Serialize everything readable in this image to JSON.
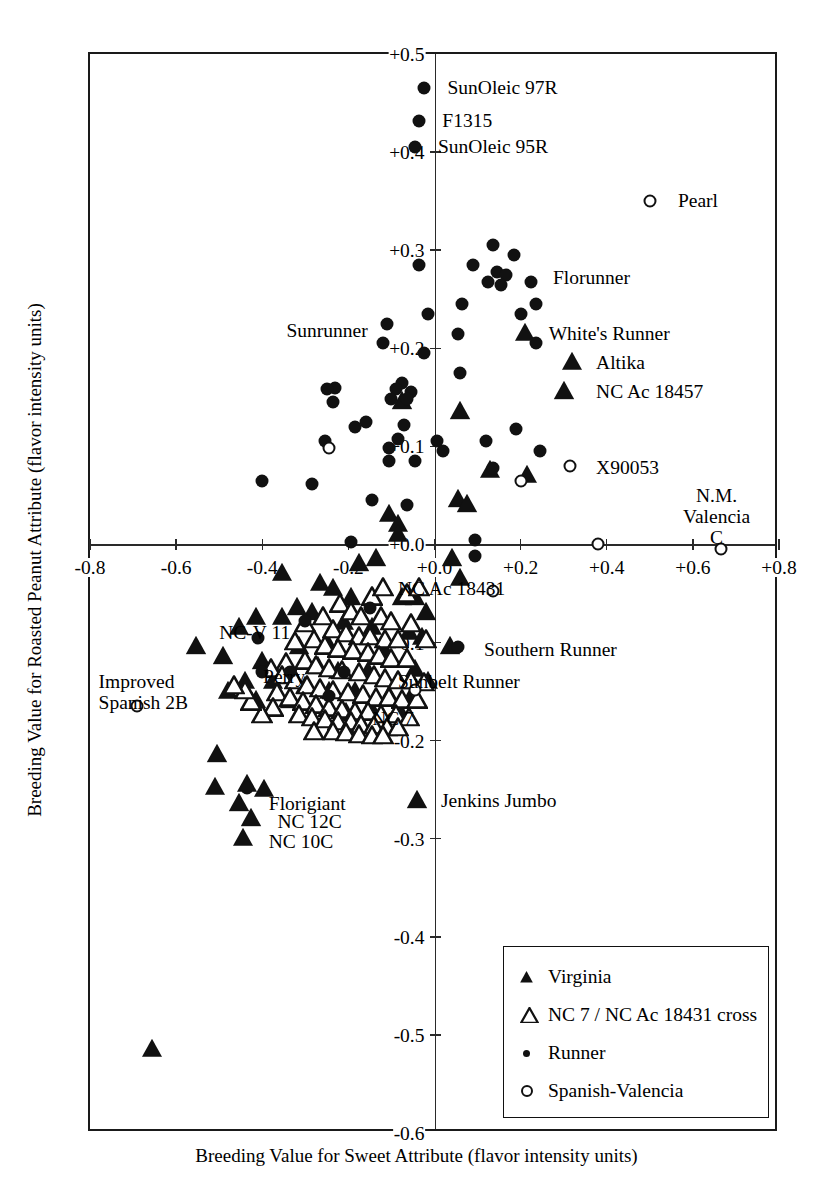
{
  "figure": {
    "x_title": "Breeding Value for Sweet Attribute (flavor intensity units)",
    "y_title": "Breeding Value for Roasted Peanut Attribute (flavor intensity units)"
  },
  "legend": {
    "items": [
      {
        "symbol": "filled-triangle-icon",
        "label": "Virginia"
      },
      {
        "symbol": "open-triangle-icon",
        "label": "NC 7 / NC Ac 18431 cross"
      },
      {
        "symbol": "small-filled-circle-icon",
        "label": "Runner"
      },
      {
        "symbol": "open-circle-icon",
        "label": "Spanish-Valencia"
      }
    ]
  },
  "chart_data": {
    "type": "scatter",
    "title": "",
    "xlabel": "Breeding Value for Sweet Attribute (flavor intensity units)",
    "ylabel": "Breeding Value for Roasted Peanut Attribute (flavor intensity units)",
    "xlim": [
      -0.8,
      0.8
    ],
    "ylim": [
      -0.6,
      0.5
    ],
    "xticks": [
      "-0.8",
      "-0.6",
      "-0.4",
      "-0.2",
      "+0.0",
      "+0.2",
      "+0.4",
      "+0.6",
      "+0.8"
    ],
    "xtick_values": [
      -0.8,
      -0.6,
      -0.4,
      -0.2,
      0.0,
      0.2,
      0.4,
      0.6,
      0.8
    ],
    "yticks": [
      "+0.5",
      "+0.4",
      "+0.3",
      "+0.2",
      "+0.1",
      "+0.0",
      "-0.1",
      "-0.2",
      "-0.3",
      "-0.4",
      "-0.5",
      "-0.6"
    ],
    "ytick_values": [
      0.5,
      0.4,
      0.3,
      0.2,
      0.1,
      0.0,
      -0.1,
      -0.2,
      -0.3,
      -0.4,
      -0.5,
      -0.6
    ],
    "grid": false,
    "legend_position": "bottom-right",
    "series": [
      {
        "name": "Virginia",
        "marker": "filled-triangle",
        "points": [
          [
            0.21,
            0.215
          ],
          [
            0.32,
            0.185
          ],
          [
            0.3,
            0.155
          ],
          [
            -0.075,
            0.145
          ],
          [
            0.06,
            0.135
          ],
          [
            0.13,
            0.075
          ],
          [
            0.055,
            0.045
          ],
          [
            0.075,
            0.04
          ],
          [
            -0.105,
            0.03
          ],
          [
            -0.085,
            0.02
          ],
          [
            0.215,
            0.07
          ],
          [
            -0.085,
            0.01
          ],
          [
            0.04,
            -0.015
          ],
          [
            0.06,
            -0.035
          ],
          [
            -0.135,
            -0.015
          ],
          [
            -0.175,
            -0.02
          ],
          [
            -0.355,
            -0.03
          ],
          [
            -0.265,
            -0.04
          ],
          [
            -0.235,
            -0.045
          ],
          [
            -0.195,
            -0.055
          ],
          [
            -0.32,
            -0.065
          ],
          [
            -0.285,
            -0.07
          ],
          [
            -0.075,
            -0.055
          ],
          [
            -0.045,
            -0.055
          ],
          [
            -0.02,
            -0.07
          ],
          [
            -0.415,
            -0.075
          ],
          [
            -0.355,
            -0.075
          ],
          [
            -0.21,
            -0.08
          ],
          [
            -0.455,
            -0.085
          ],
          [
            -0.145,
            -0.085
          ],
          [
            -0.06,
            -0.09
          ],
          [
            -0.03,
            -0.095
          ],
          [
            0.035,
            -0.105
          ],
          [
            -0.25,
            -0.1
          ],
          [
            -0.315,
            -0.105
          ],
          [
            -0.19,
            -0.11
          ],
          [
            -0.115,
            -0.11
          ],
          [
            -0.555,
            -0.105
          ],
          [
            -0.49,
            -0.115
          ],
          [
            -0.4,
            -0.12
          ],
          [
            -0.34,
            -0.125
          ],
          [
            -0.27,
            -0.125
          ],
          [
            -0.225,
            -0.13
          ],
          [
            -0.155,
            -0.13
          ],
          [
            -0.045,
            -0.128
          ],
          [
            -0.015,
            -0.14
          ],
          [
            -0.44,
            -0.14
          ],
          [
            -0.375,
            -0.14
          ],
          [
            -0.3,
            -0.145
          ],
          [
            -0.245,
            -0.15
          ],
          [
            -0.185,
            -0.15
          ],
          [
            -0.48,
            -0.15
          ],
          [
            -0.105,
            -0.155
          ],
          [
            -0.06,
            -0.16
          ],
          [
            -0.335,
            -0.16
          ],
          [
            -0.415,
            -0.16
          ],
          [
            -0.145,
            -0.17
          ],
          [
            -0.205,
            -0.172
          ],
          [
            -0.075,
            -0.175
          ],
          [
            -0.505,
            -0.215
          ],
          [
            -0.51,
            -0.248
          ],
          [
            -0.435,
            -0.245
          ],
          [
            -0.395,
            -0.25
          ],
          [
            -0.455,
            -0.265
          ],
          [
            -0.425,
            -0.28
          ],
          [
            -0.445,
            -0.3
          ],
          [
            -0.04,
            -0.262
          ],
          [
            -0.655,
            -0.515
          ]
        ]
      },
      {
        "name": "NC 7 / NC Ac 18431 cross",
        "marker": "open-triangle",
        "points": [
          [
            -0.065,
            -0.052
          ],
          [
            -0.145,
            -0.055
          ],
          [
            -0.22,
            -0.062
          ],
          [
            -0.195,
            -0.07
          ],
          [
            -0.17,
            -0.075
          ],
          [
            -0.26,
            -0.075
          ],
          [
            -0.125,
            -0.075
          ],
          [
            -0.1,
            -0.08
          ],
          [
            -0.055,
            -0.082
          ],
          [
            -0.3,
            -0.082
          ],
          [
            -0.235,
            -0.088
          ],
          [
            -0.205,
            -0.092
          ],
          [
            -0.175,
            -0.095
          ],
          [
            -0.15,
            -0.095
          ],
          [
            -0.28,
            -0.098
          ],
          [
            -0.115,
            -0.098
          ],
          [
            -0.085,
            -0.098
          ],
          [
            -0.02,
            -0.098
          ],
          [
            -0.325,
            -0.1
          ],
          [
            -0.255,
            -0.105
          ],
          [
            -0.225,
            -0.108
          ],
          [
            -0.19,
            -0.11
          ],
          [
            -0.155,
            -0.112
          ],
          [
            -0.13,
            -0.115
          ],
          [
            -0.1,
            -0.118
          ],
          [
            -0.065,
            -0.118
          ],
          [
            -0.3,
            -0.12
          ],
          [
            -0.345,
            -0.122
          ],
          [
            -0.275,
            -0.125
          ],
          [
            -0.245,
            -0.128
          ],
          [
            -0.215,
            -0.13
          ],
          [
            -0.175,
            -0.132
          ],
          [
            -0.14,
            -0.135
          ],
          [
            -0.115,
            -0.138
          ],
          [
            -0.085,
            -0.14
          ],
          [
            -0.055,
            -0.14
          ],
          [
            -0.025,
            -0.142
          ],
          [
            -0.38,
            -0.128
          ],
          [
            -0.355,
            -0.135
          ],
          [
            -0.325,
            -0.14
          ],
          [
            -0.295,
            -0.145
          ],
          [
            -0.265,
            -0.148
          ],
          [
            -0.235,
            -0.15
          ],
          [
            -0.2,
            -0.152
          ],
          [
            -0.165,
            -0.155
          ],
          [
            -0.135,
            -0.158
          ],
          [
            -0.105,
            -0.158
          ],
          [
            -0.075,
            -0.16
          ],
          [
            -0.04,
            -0.16
          ],
          [
            -0.365,
            -0.152
          ],
          [
            -0.335,
            -0.158
          ],
          [
            -0.305,
            -0.162
          ],
          [
            -0.275,
            -0.165
          ],
          [
            -0.245,
            -0.168
          ],
          [
            -0.215,
            -0.17
          ],
          [
            -0.185,
            -0.172
          ],
          [
            -0.155,
            -0.172
          ],
          [
            -0.125,
            -0.175
          ],
          [
            -0.09,
            -0.175
          ],
          [
            -0.06,
            -0.178
          ],
          [
            -0.315,
            -0.175
          ],
          [
            -0.285,
            -0.178
          ],
          [
            -0.255,
            -0.18
          ],
          [
            -0.225,
            -0.182
          ],
          [
            -0.195,
            -0.182
          ],
          [
            -0.17,
            -0.185
          ],
          [
            -0.14,
            -0.186
          ],
          [
            -0.11,
            -0.188
          ],
          [
            -0.085,
            -0.188
          ],
          [
            -0.235,
            -0.192
          ],
          [
            -0.205,
            -0.193
          ],
          [
            -0.175,
            -0.195
          ],
          [
            -0.145,
            -0.196
          ],
          [
            -0.28,
            -0.192
          ],
          [
            -0.12,
            -0.196
          ],
          [
            -0.375,
            -0.168
          ],
          [
            -0.4,
            -0.175
          ],
          [
            -0.425,
            -0.162
          ],
          [
            -0.44,
            -0.15
          ],
          [
            -0.465,
            -0.145
          ],
          [
            -0.12,
            -0.045
          ],
          [
            -0.035,
            -0.045
          ]
        ]
      },
      {
        "name": "Runner",
        "marker": "filled-circle",
        "points": [
          [
            -0.025,
            0.465
          ],
          [
            -0.035,
            0.432
          ],
          [
            -0.045,
            0.405
          ],
          [
            -0.035,
            0.285
          ],
          [
            0.135,
            0.305
          ],
          [
            0.185,
            0.295
          ],
          [
            0.09,
            0.285
          ],
          [
            0.145,
            0.278
          ],
          [
            0.165,
            0.275
          ],
          [
            0.125,
            0.268
          ],
          [
            0.155,
            0.265
          ],
          [
            0.225,
            0.268
          ],
          [
            0.235,
            0.245
          ],
          [
            0.065,
            0.245
          ],
          [
            0.2,
            0.235
          ],
          [
            -0.015,
            0.235
          ],
          [
            0.055,
            0.215
          ],
          [
            -0.11,
            0.225
          ],
          [
            -0.12,
            0.205
          ],
          [
            -0.025,
            0.195
          ],
          [
            0.235,
            0.205
          ],
          [
            0.06,
            0.175
          ],
          [
            -0.075,
            0.165
          ],
          [
            -0.055,
            0.155
          ],
          [
            -0.09,
            0.158
          ],
          [
            -0.065,
            0.148
          ],
          [
            -0.1,
            0.148
          ],
          [
            -0.23,
            0.16
          ],
          [
            -0.25,
            0.158
          ],
          [
            -0.235,
            0.145
          ],
          [
            -0.16,
            0.125
          ],
          [
            -0.185,
            0.12
          ],
          [
            -0.07,
            0.122
          ],
          [
            -0.085,
            0.108
          ],
          [
            -0.105,
            0.098
          ],
          [
            -0.255,
            0.105
          ],
          [
            -0.105,
            0.085
          ],
          [
            0.005,
            0.105
          ],
          [
            0.02,
            0.095
          ],
          [
            -0.045,
            0.085
          ],
          [
            0.19,
            0.118
          ],
          [
            0.12,
            0.105
          ],
          [
            0.245,
            0.095
          ],
          [
            0.135,
            0.078
          ],
          [
            -0.4,
            0.065
          ],
          [
            -0.285,
            0.062
          ],
          [
            -0.065,
            0.04
          ],
          [
            -0.145,
            0.045
          ],
          [
            0.095,
            0.005
          ],
          [
            -0.195,
            0.002
          ],
          [
            0.095,
            -0.012
          ],
          [
            -0.15,
            -0.065
          ],
          [
            -0.41,
            -0.095
          ],
          [
            -0.3,
            -0.078
          ],
          [
            -0.335,
            -0.13
          ],
          [
            -0.21,
            -0.13
          ],
          [
            -0.4,
            -0.13
          ],
          [
            -0.245,
            -0.155
          ],
          [
            0.055,
            -0.105
          ],
          [
            -0.435,
            -0.248
          ]
        ]
      },
      {
        "name": "Spanish-Valencia",
        "marker": "open-circle",
        "points": [
          [
            0.5,
            0.35
          ],
          [
            0.315,
            0.08
          ],
          [
            0.2,
            0.065
          ],
          [
            0.38,
            0.0
          ],
          [
            0.665,
            -0.005
          ],
          [
            -0.245,
            0.098
          ],
          [
            -0.69,
            -0.165
          ],
          [
            -0.045,
            -0.148
          ],
          [
            0.135,
            -0.047
          ]
        ]
      }
    ],
    "point_labels": [
      {
        "text": "SunOleic 97R",
        "x": 0.0,
        "y": 0.465,
        "align": "left"
      },
      {
        "text": "F1315",
        "x": -0.012,
        "y": 0.432,
        "align": "left"
      },
      {
        "text": "SunOleic 95R",
        "x": -0.022,
        "y": 0.405,
        "align": "left"
      },
      {
        "text": "Pearl",
        "x": 0.535,
        "y": 0.35,
        "align": "left"
      },
      {
        "text": "Florunner",
        "x": 0.245,
        "y": 0.272,
        "align": "left"
      },
      {
        "text": "Sunrunner",
        "x": -0.155,
        "y": 0.218,
        "align": "right-inline"
      },
      {
        "text": "White's Runner",
        "x": 0.235,
        "y": 0.215,
        "align": "left"
      },
      {
        "text": "Altika",
        "x": 0.345,
        "y": 0.185,
        "align": "left"
      },
      {
        "text": "NC Ac 18457",
        "x": 0.345,
        "y": 0.155,
        "align": "left"
      },
      {
        "text": "X90053",
        "x": 0.345,
        "y": 0.078,
        "align": "left"
      },
      {
        "text": "N.M.\nValencia C",
        "x": 0.655,
        "y": 0.03,
        "align": "center"
      },
      {
        "text": "NC Ac 18431",
        "x": -0.115,
        "y": -0.045,
        "align": "left"
      },
      {
        "text": "NC-V 11",
        "x": -0.335,
        "y": -0.09,
        "align": "right"
      },
      {
        "text": "Southern Runner",
        "x": 0.085,
        "y": -0.108,
        "align": "left"
      },
      {
        "text": "Perry",
        "x": -0.3,
        "y": -0.135,
        "align": "right"
      },
      {
        "text": "Sunbelt Runner",
        "x": -0.115,
        "y": -0.14,
        "align": "left"
      },
      {
        "text": "Improved\nSpanish 2B",
        "x": -0.78,
        "y": -0.152,
        "align": "left-block"
      },
      {
        "text": "NC 7",
        "x": -0.175,
        "y": -0.178,
        "align": "left"
      },
      {
        "text": "Jenkins Jumbo",
        "x": -0.015,
        "y": -0.262,
        "align": "left"
      },
      {
        "text": "Florigiant",
        "x": -0.415,
        "y": -0.265,
        "align": "left"
      },
      {
        "text": "NC 12C",
        "x": -0.395,
        "y": -0.283,
        "align": "left"
      },
      {
        "text": "NC 10C",
        "x": -0.415,
        "y": -0.303,
        "align": "left"
      }
    ]
  }
}
